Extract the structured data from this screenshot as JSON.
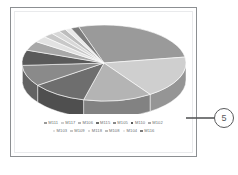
{
  "figure": {
    "callout_label": "5",
    "frame_border_color": "#8c8f92"
  },
  "chart_data": {
    "type": "pie",
    "title": "",
    "xlabel": "",
    "ylabel": "",
    "three_d": true,
    "grid": false,
    "legend_position": "bottom",
    "categories": [
      "M111",
      "M117",
      "M106",
      "M115",
      "M105",
      "M110",
      "M102",
      "M103",
      "M109",
      "M118",
      "M108",
      "M104",
      "M116"
    ],
    "values": [
      27.5,
      18.0,
      13.5,
      11.0,
      9.0,
      6.5,
      4.0,
      2.6,
      2.0,
      1.7,
      1.4,
      1.2,
      1.6
    ],
    "colors": [
      "#9a9a9a",
      "#cfcfcf",
      "#b4b4b4",
      "#6e6e6e",
      "#8a8a8a",
      "#5a5a5a",
      "#a8a8a8",
      "#e2e2e2",
      "#c8c8c8",
      "#d8d8d8",
      "#bdbdbd",
      "#eaeaea",
      "#7c7c7c"
    ]
  },
  "legend": {
    "rows": [
      [
        {
          "label": "M111",
          "color": "#9a9a9a"
        },
        {
          "label": "M117",
          "color": "#cfcfcf"
        },
        {
          "label": "M106",
          "color": "#b4b4b4"
        },
        {
          "label": "M115",
          "color": "#6e6e6e"
        },
        {
          "label": "M105",
          "color": "#8a8a8a"
        },
        {
          "label": "M110",
          "color": "#5a5a5a"
        },
        {
          "label": "M102",
          "color": "#a8a8a8"
        }
      ],
      [
        {
          "label": "M103",
          "color": "#e2e2e2"
        },
        {
          "label": "M109",
          "color": "#c8c8c8"
        },
        {
          "label": "M118",
          "color": "#d8d8d8"
        },
        {
          "label": "M108",
          "color": "#bdbdbd"
        },
        {
          "label": "M104",
          "color": "#eaeaea"
        },
        {
          "label": "M116",
          "color": "#7c7c7c"
        }
      ]
    ]
  }
}
